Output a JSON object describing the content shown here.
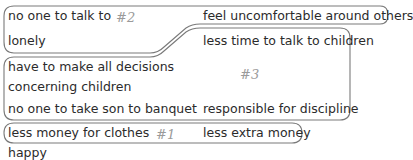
{
  "groups": {
    "group2": {
      "tag": "#2",
      "items": [
        "no one to talk to",
        "lonely",
        "feel uncomfortable around others"
      ]
    },
    "group3": {
      "tag": "#3",
      "items": [
        "less time to talk to children",
        "have to make all decisions",
        "concerning children",
        "no one to take son to banquet",
        "responsible for discipline"
      ]
    },
    "group1": {
      "tag": "#1",
      "items": [
        "less money for clothes",
        "less extra money"
      ]
    }
  },
  "ungrouped": {
    "items": [
      "happy"
    ]
  },
  "colors": {
    "text": "#2b2b2b",
    "outline": "#7a7a7a",
    "tag": "#9a9a9a"
  }
}
